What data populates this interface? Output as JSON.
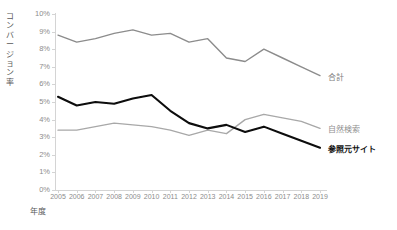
{
  "chart_data": {
    "type": "line",
    "title": "",
    "xlabel": "年度",
    "ylabel": "コンバージョン率",
    "categories": [
      "2005",
      "2006",
      "2007",
      "2008",
      "2009",
      "2010",
      "2011",
      "2012",
      "2013",
      "2014",
      "2015",
      "2016",
      "2017",
      "2018",
      "2019"
    ],
    "ylim": [
      0,
      10
    ],
    "ytick_labels": [
      "10%",
      "9%",
      "8%",
      "7%",
      "6%",
      "5%",
      "4%",
      "3%",
      "2%",
      "1%",
      "0%"
    ],
    "ytick_values": [
      10,
      9,
      8,
      7,
      6,
      5,
      4,
      3,
      2,
      1,
      0
    ],
    "yunit": "%",
    "grid": false,
    "legend_position": "right-of-line-ends",
    "series": [
      {
        "name": "合計",
        "color": "#8c8c8c",
        "width": 1.4,
        "values": [
          8.8,
          8.4,
          8.6,
          8.9,
          9.1,
          8.8,
          8.9,
          8.4,
          8.6,
          7.5,
          7.3,
          8.0,
          7.5,
          7.0,
          6.5
        ]
      },
      {
        "name": "自然検索",
        "color": "#a8a8a8",
        "width": 1.4,
        "values": [
          3.4,
          3.4,
          3.6,
          3.8,
          3.7,
          3.6,
          3.4,
          3.1,
          3.4,
          3.2,
          4.0,
          4.3,
          4.1,
          3.9,
          3.5
        ]
      },
      {
        "name": "参照元サイト",
        "color": "#0d0d0d",
        "width": 2.1,
        "values": [
          5.3,
          4.8,
          5.0,
          4.9,
          5.2,
          5.4,
          4.5,
          3.8,
          3.5,
          3.7,
          3.3,
          3.6,
          3.2,
          2.8,
          2.4
        ]
      }
    ]
  },
  "axis": {
    "y_title": "コンバージョン率",
    "y_title_chars": [
      "コ",
      "ン",
      "バ",
      "ー",
      "ジ",
      "ョ",
      "ン",
      "率"
    ],
    "x_title": "年度"
  },
  "legend": {
    "items": [
      {
        "label": "合計",
        "style": "accent-total"
      },
      {
        "label": "自然検索",
        "style": "accent-organic"
      },
      {
        "label": "参照元サイト",
        "style": "accent-referral"
      }
    ]
  }
}
